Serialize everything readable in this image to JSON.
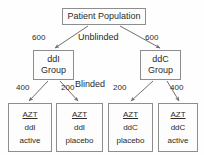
{
  "diagram": {
    "title": "Patient Population",
    "root": {
      "label": "Patient Population",
      "x": 62,
      "y": 8,
      "w": 84,
      "h": 17
    },
    "stages": [
      {
        "name": "unblinded-stage-label",
        "label": "Unblinded",
        "x": 78,
        "y": 32
      },
      {
        "name": "blinded-stage-label",
        "label": "Blinded",
        "x": 75,
        "y": 79
      }
    ],
    "groups": [
      {
        "name": "ddi-group",
        "drug": "ddI",
        "suffix": "Group",
        "allocation": "600",
        "allocation_x": 32,
        "allocation_y": 33,
        "x": 33,
        "y": 50,
        "w": 41,
        "h": 30
      },
      {
        "name": "ddc-group",
        "drug": "ddC",
        "suffix": "Group",
        "allocation": "600",
        "allocation_x": 145,
        "allocation_y": 33,
        "x": 140,
        "y": 50,
        "w": 41,
        "h": 30
      }
    ],
    "arms": [
      {
        "name": "azt-ddi-active",
        "drug": "AZT",
        "companion": "ddI",
        "status": "active",
        "allocation": "400",
        "allocation_x": 16,
        "allocation_y": 83,
        "x": 8,
        "y": 103,
        "w": 44,
        "h": 49
      },
      {
        "name": "azt-ddi-placebo",
        "drug": "AZT",
        "companion": "ddI",
        "status": "placebo",
        "allocation": "200",
        "allocation_x": 61,
        "allocation_y": 83,
        "x": 56,
        "y": 103,
        "w": 47,
        "h": 49
      },
      {
        "name": "azt-ddc-placebo",
        "drug": "AZT",
        "companion": "ddC",
        "status": "placebo",
        "allocation": "200",
        "allocation_x": 113,
        "allocation_y": 83,
        "x": 108,
        "y": 103,
        "w": 45,
        "h": 49
      },
      {
        "name": "azt-ddc-active",
        "drug": "AZT",
        "companion": "ddC",
        "status": "active",
        "allocation": "400",
        "allocation_x": 170,
        "allocation_y": 83,
        "x": 158,
        "y": 103,
        "w": 40,
        "h": 49
      }
    ],
    "colors": {
      "background": "#fefefe",
      "box_border": "#8d8d8d",
      "box_fill": "#fdfdfd",
      "text": "#2b2b2b",
      "edge": "#6f6f6f"
    }
  }
}
